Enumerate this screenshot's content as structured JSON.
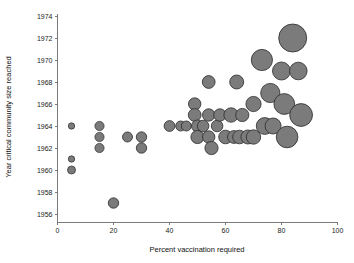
{
  "chart_data": {
    "type": "scatter",
    "title": "",
    "xlabel": "Percent vaccination required",
    "ylabel": "Year critical community size reached",
    "xlim": [
      0,
      100
    ],
    "ylim": [
      1955,
      1975
    ],
    "grid": false,
    "legend": "none",
    "x_ticks": [
      0,
      20,
      40,
      60,
      80,
      100
    ],
    "x_tick_labels": [
      "0",
      "20",
      "40",
      "60",
      "80",
      "100"
    ],
    "y_ticks": [
      1956,
      1958,
      1960,
      1962,
      1964,
      1966,
      1968,
      1970,
      1972,
      1974
    ],
    "y_tick_labels": [
      "1956",
      "1958",
      "1960",
      "1962",
      "1964",
      "1966",
      "1968",
      "1970",
      "1972",
      "1974"
    ],
    "marker_fill": "#7b7b7b",
    "marker_edge": "#2b2b2b",
    "size_encodes": "population size (bubble area)",
    "points": [
      {
        "x": 5,
        "y": 1964,
        "r": 3.2
      },
      {
        "x": 5,
        "y": 1961,
        "r": 3.2
      },
      {
        "x": 5,
        "y": 1960,
        "r": 4.0
      },
      {
        "x": 15,
        "y": 1964,
        "r": 4.6
      },
      {
        "x": 15,
        "y": 1963,
        "r": 4.6
      },
      {
        "x": 15,
        "y": 1962,
        "r": 4.6
      },
      {
        "x": 20,
        "y": 1957,
        "r": 5.2
      },
      {
        "x": 25,
        "y": 1963,
        "r": 5.0
      },
      {
        "x": 30,
        "y": 1963,
        "r": 5.2
      },
      {
        "x": 30,
        "y": 1962,
        "r": 5.2
      },
      {
        "x": 40,
        "y": 1964,
        "r": 5.4
      },
      {
        "x": 44,
        "y": 1964,
        "r": 5.0
      },
      {
        "x": 46,
        "y": 1964,
        "r": 5.0
      },
      {
        "x": 49,
        "y": 1966,
        "r": 6.2
      },
      {
        "x": 49,
        "y": 1965,
        "r": 6.4
      },
      {
        "x": 50,
        "y": 1964,
        "r": 6.0
      },
      {
        "x": 50,
        "y": 1963,
        "r": 6.6
      },
      {
        "x": 52,
        "y": 1964,
        "r": 5.8
      },
      {
        "x": 54,
        "y": 1968,
        "r": 6.4
      },
      {
        "x": 54,
        "y": 1965,
        "r": 6.2
      },
      {
        "x": 54,
        "y": 1963,
        "r": 6.2
      },
      {
        "x": 55,
        "y": 1962,
        "r": 6.6
      },
      {
        "x": 57,
        "y": 1964,
        "r": 5.8
      },
      {
        "x": 58,
        "y": 1965,
        "r": 6.2
      },
      {
        "x": 60,
        "y": 1963,
        "r": 6.8
      },
      {
        "x": 62,
        "y": 1965,
        "r": 7.2
      },
      {
        "x": 63,
        "y": 1963,
        "r": 6.4
      },
      {
        "x": 64,
        "y": 1968,
        "r": 7.0
      },
      {
        "x": 65,
        "y": 1963,
        "r": 6.8
      },
      {
        "x": 66,
        "y": 1965,
        "r": 6.6
      },
      {
        "x": 68,
        "y": 1963,
        "r": 7.0
      },
      {
        "x": 70,
        "y": 1966,
        "r": 7.6
      },
      {
        "x": 70,
        "y": 1963,
        "r": 7.2
      },
      {
        "x": 73,
        "y": 1970,
        "r": 10.6
      },
      {
        "x": 74,
        "y": 1964,
        "r": 8.4
      },
      {
        "x": 76,
        "y": 1967,
        "r": 9.6
      },
      {
        "x": 77,
        "y": 1964,
        "r": 8.0
      },
      {
        "x": 80,
        "y": 1969,
        "r": 9.0
      },
      {
        "x": 81,
        "y": 1966,
        "r": 10.4
      },
      {
        "x": 82,
        "y": 1963,
        "r": 10.8
      },
      {
        "x": 84,
        "y": 1972,
        "r": 14.0
      },
      {
        "x": 86,
        "y": 1969,
        "r": 8.8
      },
      {
        "x": 87,
        "y": 1965,
        "r": 11.4
      }
    ]
  },
  "axis_titles": {
    "x": "Percent vaccination required",
    "y": "Year critical community size reached"
  }
}
